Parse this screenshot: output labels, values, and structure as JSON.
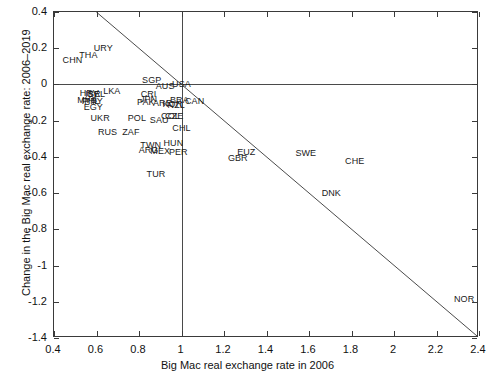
{
  "chart_data": {
    "type": "scatter",
    "title": "",
    "xlabel": "Big Mac real exchange rate in  2006",
    "ylabel": "Change in the Big Mac real exchange rate: 2006–2019",
    "xlim": [
      0.4,
      2.4
    ],
    "ylim": [
      -1.4,
      0.4
    ],
    "xticks": [
      "0.4",
      "0.6",
      "0.8",
      "1",
      "1.2",
      "1.4",
      "1.6",
      "1.8",
      "2",
      "2.2",
      "2.4"
    ],
    "xtick_values": [
      0.4,
      0.6,
      0.8,
      1.0,
      1.2,
      1.4,
      1.6,
      1.8,
      2.0,
      2.2,
      2.4
    ],
    "yticks": [
      "0.4",
      "0.2",
      "0",
      "-0.2",
      "-0.4",
      "-0.6",
      "-0.8",
      "-1",
      "-1.2",
      "-1.4"
    ],
    "ytick_values": [
      0.4,
      0.2,
      0,
      -0.2,
      -0.4,
      -0.6,
      -0.8,
      -1.0,
      -1.2,
      -1.4
    ],
    "grid": false,
    "legend": null,
    "marker_style": "text-label-only",
    "reference_lines": [
      {
        "name": "zero-change-horizontal",
        "type": "horizontal",
        "y": 0.0
      },
      {
        "name": "unity-rate-vertical",
        "type": "vertical",
        "x": 1.0
      },
      {
        "name": "full-reversion-diagonal",
        "type": "segment",
        "x1": 0.6,
        "y1": 0.4,
        "x2": 2.4,
        "y2": -1.4,
        "slope": -1.0,
        "intercept": 1.0
      }
    ],
    "points": [
      {
        "label": "CHN",
        "x": 0.487,
        "y": 0.137
      },
      {
        "label": "THA",
        "x": 0.562,
        "y": 0.165
      },
      {
        "label": "URY",
        "x": 0.632,
        "y": 0.203
      },
      {
        "label": "HRV",
        "x": 0.566,
        "y": -0.048
      },
      {
        "label": "ISR",
        "x": 0.583,
        "y": -0.05
      },
      {
        "label": "BEL",
        "x": 0.6,
        "y": -0.05
      },
      {
        "label": "MYS",
        "x": 0.556,
        "y": -0.088
      },
      {
        "label": "PHL",
        "x": 0.573,
        "y": -0.09
      },
      {
        "label": "PRY",
        "x": 0.586,
        "y": -0.09
      },
      {
        "label": "EGY",
        "x": 0.585,
        "y": -0.122
      },
      {
        "label": "LKA",
        "x": 0.672,
        "y": -0.035
      },
      {
        "label": "UKR",
        "x": 0.617,
        "y": -0.185
      },
      {
        "label": "RUS",
        "x": 0.652,
        "y": -0.26
      },
      {
        "label": "SGP",
        "x": 0.86,
        "y": 0.022
      },
      {
        "label": "CRI",
        "x": 0.845,
        "y": -0.055
      },
      {
        "label": "JPN",
        "x": 0.845,
        "y": -0.082
      },
      {
        "label": "PAK",
        "x": 0.832,
        "y": -0.098
      },
      {
        "label": "POL",
        "x": 0.79,
        "y": -0.188
      },
      {
        "label": "ZAF",
        "x": 0.762,
        "y": -0.262
      },
      {
        "label": "AUS",
        "x": 0.923,
        "y": -0.008
      },
      {
        "label": "ARE",
        "x": 0.91,
        "y": -0.103
      },
      {
        "label": "SAU",
        "x": 0.895,
        "y": -0.196
      },
      {
        "label": "TWN",
        "x": 0.855,
        "y": -0.337
      },
      {
        "label": "ARG",
        "x": 0.845,
        "y": -0.362
      },
      {
        "label": "MEX",
        "x": 0.9,
        "y": -0.365
      },
      {
        "label": "KOR",
        "x": 0.957,
        "y": -0.108
      },
      {
        "label": "NZL",
        "x": 0.975,
        "y": -0.115
      },
      {
        "label": "COL",
        "x": 0.948,
        "y": -0.172
      },
      {
        "label": "CZE",
        "x": 0.966,
        "y": -0.176
      },
      {
        "label": "BRA",
        "x": 0.99,
        "y": -0.085
      },
      {
        "label": "USA",
        "x": 1.0,
        "y": 0.0
      },
      {
        "label": "CAN",
        "x": 1.062,
        "y": -0.093
      },
      {
        "label": "CHL",
        "x": 1.0,
        "y": -0.238
      },
      {
        "label": "HUN",
        "x": 0.962,
        "y": -0.325
      },
      {
        "label": "PER",
        "x": 0.985,
        "y": -0.372
      },
      {
        "label": "TUR",
        "x": 0.88,
        "y": -0.492
      },
      {
        "label": "EUZ",
        "x": 1.305,
        "y": -0.372
      },
      {
        "label": "GBR",
        "x": 1.265,
        "y": -0.405
      },
      {
        "label": "SWE",
        "x": 1.585,
        "y": -0.378
      },
      {
        "label": "CHE",
        "x": 1.815,
        "y": -0.42
      },
      {
        "label": "DNK",
        "x": 1.705,
        "y": -0.598
      },
      {
        "label": "NOR",
        "x": 2.33,
        "y": -1.182
      }
    ]
  }
}
